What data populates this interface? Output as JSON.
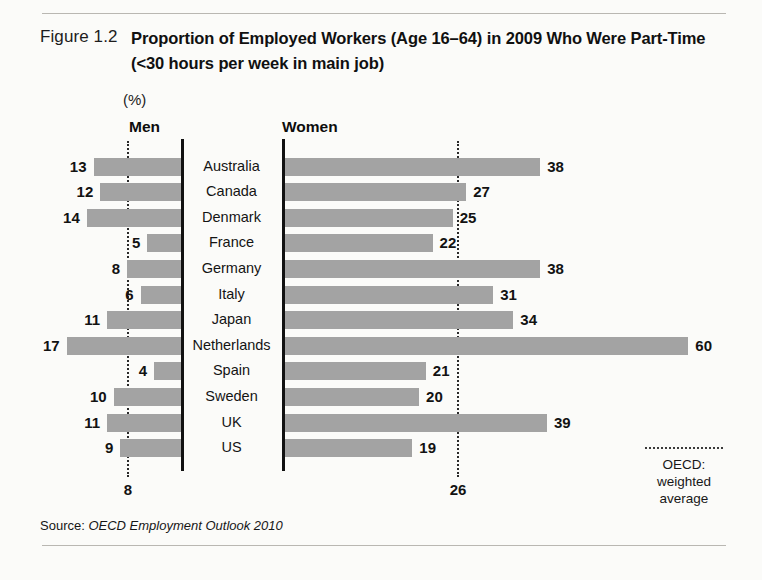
{
  "figure": {
    "label": "Figure 1.2",
    "title": "Proportion of Employed Workers (Age 16–64) in 2009 Who Were Part-Time (<30 hours per week in main job)",
    "unit_label": "(%)",
    "source_prefix": "Source: ",
    "source_text": "OECD Employment Outlook 2010"
  },
  "legend": {
    "line_1": "OECD:",
    "line_2": "weighted",
    "line_3": "average"
  },
  "colors": {
    "bar": "#a3a3a3",
    "axis": "#111111",
    "average_line": "#2a2a2a",
    "rule": "#b9b7b2",
    "background": "#fbfbf9"
  },
  "chart_data": {
    "type": "bar",
    "orientation": "horizontal",
    "layout": "diverging-paired (Men left-growing, Women right-growing, shared country axis)",
    "title": "Proportion of Employed Workers (Age 16–64) in 2009 Who Were Part-Time (<30 hours per week in main job)",
    "xlabel": "",
    "ylabel": "",
    "unit": "%",
    "grid": false,
    "legend_position": "bottom-right",
    "categories": [
      "Australia",
      "Canada",
      "Denmark",
      "France",
      "Germany",
      "Italy",
      "Japan",
      "Netherlands",
      "Spain",
      "Sweden",
      "UK",
      "US"
    ],
    "series": [
      {
        "name": "Men",
        "values": [
          13,
          12,
          14,
          5,
          8,
          6,
          11,
          17,
          4,
          10,
          11,
          9
        ],
        "average_label": "8",
        "average_value": 8,
        "axis_max": 18
      },
      {
        "name": "Women",
        "values": [
          38,
          27,
          25,
          22,
          38,
          31,
          34,
          60,
          21,
          20,
          39,
          19
        ],
        "average_label": "26",
        "average_value": 26,
        "axis_max": 62
      }
    ],
    "annotations": [
      {
        "text": "OECD: weighted average",
        "style": "dotted-line"
      }
    ]
  }
}
